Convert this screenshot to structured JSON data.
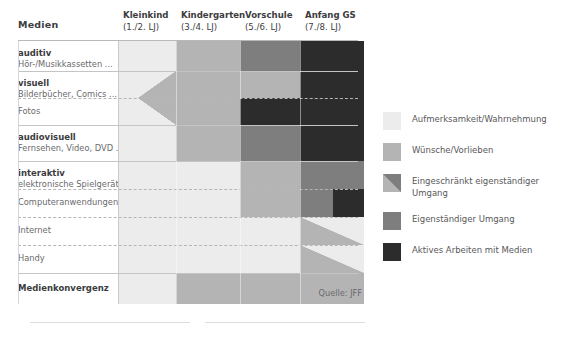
{
  "title": "Medien",
  "source_note": "Quelle: JFF",
  "colors": {
    "c1": "#ececec",
    "c2": "#b4b4b4",
    "c3": "#7e7e7e",
    "c4": "#2c2c2c",
    "background": "#ffffff",
    "grid_line": "#c9c9cb",
    "text": "#58585a"
  },
  "columns": [
    {
      "label": "Kleinkind",
      "sub": "(1./2. LJ)",
      "left": 118,
      "width": 58
    },
    {
      "label": "Kindergarten",
      "sub": "(3./4. LJ)",
      "left": 176,
      "width": 64
    },
    {
      "label": "Vorschule",
      "sub": "(5./6. LJ)",
      "left": 240,
      "width": 60
    },
    {
      "label": "Anfang GS",
      "sub": "(7./8. LJ)",
      "left": 300,
      "width": 64
    }
  ],
  "rows": [
    {
      "name": "auditiv",
      "sub": "Hör-/Musikkassetten ...",
      "bold": true,
      "sep": "solid"
    },
    {
      "name": "visuell",
      "sub": "Bilderbücher, Comics ...",
      "bold": true,
      "sep": "solid"
    },
    {
      "name": "Fotos",
      "sub": "",
      "bold": false,
      "sep": "dash"
    },
    {
      "name": "audiovisuell",
      "sub": "Fernsehen, Video, DVD ...",
      "bold": true,
      "sep": "solid"
    },
    {
      "name": "interaktiv",
      "sub": "elektronische Spielgeräte",
      "bold": true,
      "sep": "solid"
    },
    {
      "name": "Computeranwendungen",
      "sub": "",
      "bold": false,
      "sep": "dash"
    },
    {
      "name": "Internet",
      "sub": "",
      "bold": false,
      "sep": "dash"
    },
    {
      "name": "Handy",
      "sub": "",
      "bold": false,
      "sep": "dash"
    },
    {
      "name": "Medienkonvergenz",
      "sub": "",
      "bold": true,
      "sep": "solid"
    }
  ],
  "legend": [
    {
      "label": "Aufmerksamkeit/Wahrnehmung",
      "type": "solid",
      "color": "#ececec"
    },
    {
      "label": "Wünsche/Vorlieben",
      "type": "solid",
      "color": "#b4b4b4"
    },
    {
      "label": "Eingeschränkt eigenständiger Umgang",
      "type": "diag",
      "color": "#b4b4b4",
      "color2": "#7e7e7e"
    },
    {
      "label": "Eigenständiger Umgang",
      "type": "solid",
      "color": "#7e7e7e"
    },
    {
      "label": "Aktives Arbeiten mit Medien",
      "type": "solid",
      "color": "#2c2c2c"
    }
  ],
  "chart_data": {
    "type": "heatmap",
    "title": "Medien",
    "xlabel": "",
    "ylabel": "",
    "categories": [
      "Kleinkind (1./2. LJ)",
      "Kindergarten (3./4. LJ)",
      "Vorschule (5./6. LJ)",
      "Anfang GS (7./8. LJ)"
    ],
    "levels": [
      {
        "key": "c1",
        "name": "Aufmerksamkeit/Wahrnehmung",
        "color": "#ececec"
      },
      {
        "key": "c2",
        "name": "Wünsche/Vorlieben",
        "color": "#b4b4b4"
      },
      {
        "key": "c3",
        "name": "Eingeschränkt eigenständiger Umgang",
        "color": "#7e7e7e"
      },
      {
        "key": "c4",
        "name": "Aktives Arbeiten mit Medien",
        "color": "#2c2c2c"
      }
    ],
    "legend_position": "right",
    "grid": true,
    "rows": [
      {
        "label": "auditiv",
        "values": [
          "c1",
          "c2",
          "c3",
          "c4"
        ]
      },
      {
        "label": "visuell",
        "values": [
          "c1",
          "c2",
          "c2",
          "c4"
        ]
      },
      {
        "label": "Fotos",
        "values": [
          "c1",
          "c2",
          "c2",
          "c4"
        ]
      },
      {
        "label": "audiovisuell",
        "values": [
          "c1",
          "c2",
          "c3",
          "c4"
        ]
      },
      {
        "label": "interaktiv",
        "values": [
          "c1",
          "c1",
          "c2",
          "c3"
        ]
      },
      {
        "label": "Computeranwendungen",
        "values": [
          "c1",
          "c1",
          "c2",
          "c3"
        ]
      },
      {
        "label": "Internet",
        "values": [
          "c1",
          "c1",
          "c1",
          "c2"
        ]
      },
      {
        "label": "Handy",
        "values": [
          "c1",
          "c1",
          "c1",
          "c2"
        ]
      },
      {
        "label": "Medienkonvergenz",
        "values": [
          "c1",
          "c2",
          "c2",
          "c2"
        ]
      }
    ]
  }
}
